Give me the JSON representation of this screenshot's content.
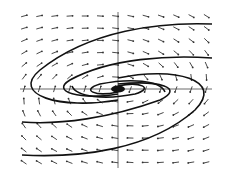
{
  "chart_data": {
    "type": "phase-portrait",
    "title": "",
    "xlabel": "",
    "ylabel": "",
    "equilibrium": {
      "x": 0,
      "y": 0,
      "kind": "spiral"
    },
    "axes": {
      "origin_px": [
        118,
        89
      ],
      "x_extent_px": [
        20,
        212
      ],
      "y_extent_px": [
        12,
        168
      ],
      "grid": false
    },
    "field": {
      "cols": 13,
      "rows": 13,
      "x_px_start": 24,
      "x_px_step": 15.2,
      "y_px_start": 16,
      "y_px_step": 12.2
    },
    "trajectories": [
      {
        "name": "outer-top",
        "path": "M 212 24 C 160 22, 90 30, 40 70 C 10 95, 60 110, 118 100"
      },
      {
        "name": "outer-bottom",
        "path": "M 22 155 C 80 158, 150 150, 195 110 C 225 80, 175 66, 118 78"
      },
      {
        "name": "mid-top",
        "path": "M 212 58 C 170 55, 110 58, 70 80 C 50 92, 80 100, 118 94"
      },
      {
        "name": "mid-bottom",
        "path": "M 22 122 C 60 125, 110 118, 160 100 C 185 88, 160 80, 118 84"
      },
      {
        "name": "inner-1",
        "path": "M 165 92 C 160 80, 130 78, 100 84 C 80 90, 95 97, 118 92"
      },
      {
        "name": "inner-2",
        "path": "M 72 86 C 76 97, 105 100, 135 94 C 155 88, 140 81, 118 86"
      }
    ],
    "colors": {
      "curve": "#111111",
      "arrow": "#333333",
      "axis": "#444444",
      "background": "#ffffff"
    }
  }
}
